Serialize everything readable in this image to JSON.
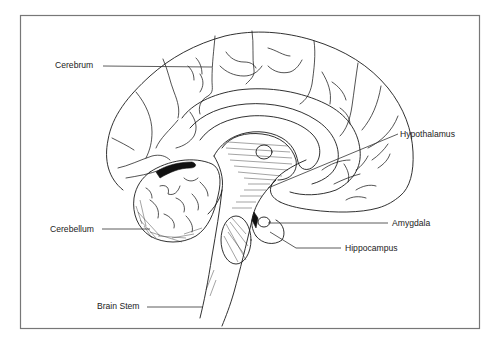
{
  "diagram": {
    "type": "anatomical-illustration",
    "labels": [
      {
        "id": "cerebrum",
        "text": "Cerebrum"
      },
      {
        "id": "hypothalamus",
        "text": "Hypothalamus"
      },
      {
        "id": "cerebellum",
        "text": "Cerebellum"
      },
      {
        "id": "amygdala",
        "text": "Amygdala"
      },
      {
        "id": "hippocampus",
        "text": "Hippocampus"
      },
      {
        "id": "brain-stem",
        "text": "Brain Stem"
      }
    ],
    "colors": {
      "line": "#1a1a1a",
      "frame": "#777777",
      "background": "#ffffff"
    }
  }
}
